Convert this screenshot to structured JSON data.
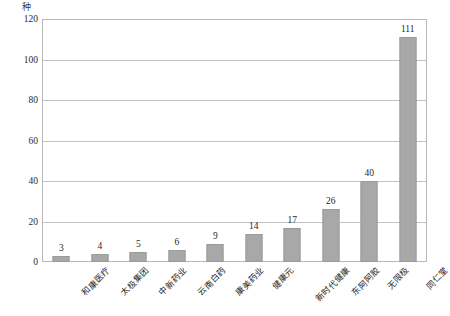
{
  "chart_data": {
    "type": "bar",
    "title": "",
    "subtitle": "",
    "xlabel": "",
    "ylabel": "种",
    "unit_caption": "种",
    "categories": [
      "和康医疗",
      "太极集团",
      "中新药业",
      "云南白药",
      "康美药业",
      "健康元",
      "新时代健康",
      "东阿阿胶",
      "无限极",
      "同仁堂"
    ],
    "values": [
      3,
      4,
      5,
      6,
      9,
      14,
      17,
      26,
      40,
      111
    ],
    "value_labels": [
      "3",
      "4",
      "5",
      "6",
      "9",
      "14",
      "17",
      "26",
      "40",
      "111"
    ],
    "ylim": [
      0,
      120
    ],
    "ytick_values": [
      0,
      20,
      40,
      60,
      80,
      100,
      120
    ],
    "ytick_labels": [
      "0",
      "20",
      "40",
      "60",
      "80",
      "100",
      "120"
    ],
    "grid": true,
    "grid_axis": "y",
    "legend": false,
    "legend_position": "none",
    "bar_color": "#a8a8a8",
    "bar_edge_color": "#9a9a9a",
    "grid_color": "#c2c2c2",
    "frame_color": "#b8b8b8",
    "text_color": "#1f1f1f",
    "background": "#ffffff"
  }
}
